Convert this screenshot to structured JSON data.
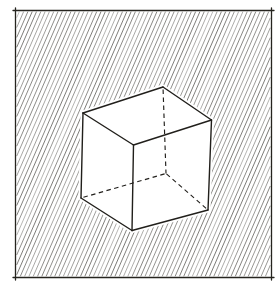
{
  "canvas": {
    "width": 278,
    "height": 285,
    "background": "#ffffff"
  },
  "frame": {
    "x": 15.5,
    "y": 10.5,
    "width": 256,
    "height": 267,
    "stroke": "#26241f",
    "stroke_width": 1.3,
    "corner_overshoot": 2.5
  },
  "hatch": {
    "slope_k": 2.3,
    "spacing_x": 4.3,
    "stroke": "#56544f",
    "stroke_width": 0.65,
    "inset": 1.2
  },
  "cube": {
    "fill": "#ffffff",
    "halo_width": 5,
    "stroke": "#211f1b",
    "solid_width": 1.4,
    "hidden_width": 1.15,
    "dash": "4.5 3.5",
    "vertices": {
      "back_top": [
        163,
        87
      ],
      "left_top": [
        83,
        113
      ],
      "right_top": [
        211.5,
        120
      ],
      "front_top": [
        133.5,
        145
      ],
      "left_bottom": [
        81,
        198
      ],
      "front_bottom": [
        132,
        230.5
      ],
      "right_bottom": [
        208,
        210
      ],
      "back_bottom": [
        166,
        173.5
      ]
    },
    "silhouette": [
      "back_top",
      "right_top",
      "right_bottom",
      "front_bottom",
      "left_bottom",
      "left_top"
    ],
    "solid_edges": [
      [
        "back_top",
        "left_top"
      ],
      [
        "back_top",
        "right_top"
      ],
      [
        "left_top",
        "front_top"
      ],
      [
        "right_top",
        "front_top"
      ],
      [
        "left_top",
        "left_bottom"
      ],
      [
        "front_top",
        "front_bottom"
      ],
      [
        "right_top",
        "right_bottom"
      ],
      [
        "left_bottom",
        "front_bottom"
      ],
      [
        "front_bottom",
        "right_bottom"
      ]
    ],
    "hidden_edges": [
      [
        "back_top",
        "back_bottom"
      ],
      [
        "left_bottom",
        "back_bottom"
      ],
      [
        "right_bottom",
        "back_bottom"
      ]
    ]
  }
}
